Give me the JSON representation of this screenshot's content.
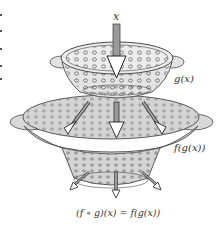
{
  "labels": {
    "input": "x",
    "inner": "g(x)",
    "outer": "f(g(x))",
    "result": "(f ∘ g)(x) = f(g(x))"
  },
  "colors": {
    "bowl_fill": "#d4d4d4",
    "bowl_light": "#e6e6e6",
    "outline": "#4a4a4a",
    "arrow_fill": "#9a9a9a",
    "text": "#333333"
  }
}
